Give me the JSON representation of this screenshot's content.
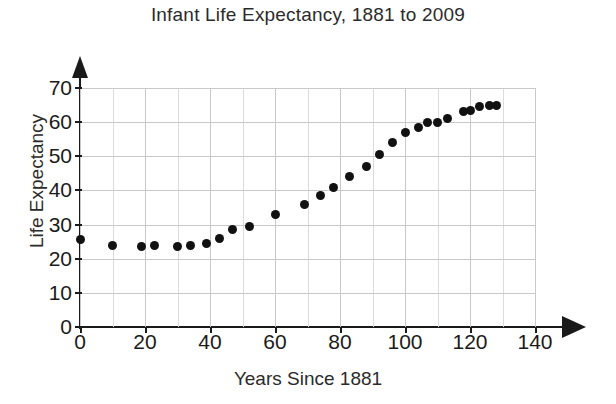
{
  "chart_data": {
    "type": "scatter",
    "title": "Infant Life Expectancy, 1881 to 2009",
    "xlabel": "Years Since 1881",
    "ylabel": "Life Expectancy",
    "xlim": [
      0,
      140
    ],
    "ylim": [
      0,
      70
    ],
    "xticks": [
      0,
      20,
      40,
      60,
      80,
      100,
      120,
      140
    ],
    "yticks": [
      0,
      10,
      20,
      30,
      40,
      50,
      60,
      70
    ],
    "x_minor_step": 10,
    "grid": true,
    "legend": null,
    "marker": "filled-circle",
    "marker_color": "#111111",
    "points": [
      {
        "x": 0,
        "y": 25.5
      },
      {
        "x": 10,
        "y": 24.0
      },
      {
        "x": 19,
        "y": 23.5
      },
      {
        "x": 23,
        "y": 24.0
      },
      {
        "x": 30,
        "y": 23.5
      },
      {
        "x": 34,
        "y": 24.0
      },
      {
        "x": 39,
        "y": 24.5
      },
      {
        "x": 43,
        "y": 26.0
      },
      {
        "x": 47,
        "y": 28.5
      },
      {
        "x": 52,
        "y": 29.5
      },
      {
        "x": 60,
        "y": 33.0
      },
      {
        "x": 69,
        "y": 36.0
      },
      {
        "x": 74,
        "y": 38.5
      },
      {
        "x": 78,
        "y": 41.0
      },
      {
        "x": 83,
        "y": 44.0
      },
      {
        "x": 88,
        "y": 47.0
      },
      {
        "x": 92,
        "y": 50.5
      },
      {
        "x": 96,
        "y": 54.0
      },
      {
        "x": 100,
        "y": 57.0
      },
      {
        "x": 104,
        "y": 58.5
      },
      {
        "x": 107,
        "y": 60.0
      },
      {
        "x": 110,
        "y": 60.0
      },
      {
        "x": 113,
        "y": 61.0
      },
      {
        "x": 118,
        "y": 63.0
      },
      {
        "x": 120,
        "y": 63.5
      },
      {
        "x": 123,
        "y": 64.5
      },
      {
        "x": 126,
        "y": 65.0
      },
      {
        "x": 128,
        "y": 65.0
      }
    ]
  }
}
